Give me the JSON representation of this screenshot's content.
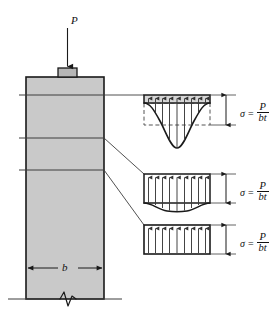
{
  "figure": {
    "colors": {
      "column_fill": "#c9c9c9",
      "plate_fill": "#b6b6b6",
      "outline": "#1a1a1a",
      "thin_line": "#4a4a4a",
      "background": "#ffffff"
    },
    "load": {
      "label": "P",
      "arrow_name": "load-arrow-down"
    },
    "column": {
      "width_label": "b",
      "dimension_name": "column-width-dimension",
      "break_symbol": "break-zigzag-icon",
      "ground_line": "ground-line"
    },
    "sections": [
      {
        "id": "section-1",
        "name": "section-line-upper"
      },
      {
        "id": "section-2",
        "name": "section-line-middle"
      },
      {
        "id": "section-3",
        "name": "section-line-lower"
      }
    ],
    "stress_diagrams": [
      {
        "id": "stress-diagram-1",
        "name": "stress-distribution-near-load",
        "shape": "deep-peaked-nonuniform",
        "arrow_count": 9,
        "has_dashed_reference": true,
        "equation": {
          "sigma": "σ",
          "equals": "=",
          "numerator": "P",
          "denominator": "bt"
        }
      },
      {
        "id": "stress-diagram-2",
        "name": "stress-distribution-transition",
        "shape": "shallow-sagging-nonuniform",
        "arrow_count": 9,
        "has_dashed_reference": true,
        "equation": {
          "sigma": "σ",
          "equals": "=",
          "numerator": "P",
          "denominator": "bt"
        }
      },
      {
        "id": "stress-diagram-3",
        "name": "stress-distribution-uniform",
        "shape": "uniform-rectangular",
        "arrow_count": 9,
        "has_dashed_reference": false,
        "equation": {
          "sigma": "σ",
          "equals": "=",
          "numerator": "P",
          "denominator": "bt"
        }
      }
    ]
  }
}
